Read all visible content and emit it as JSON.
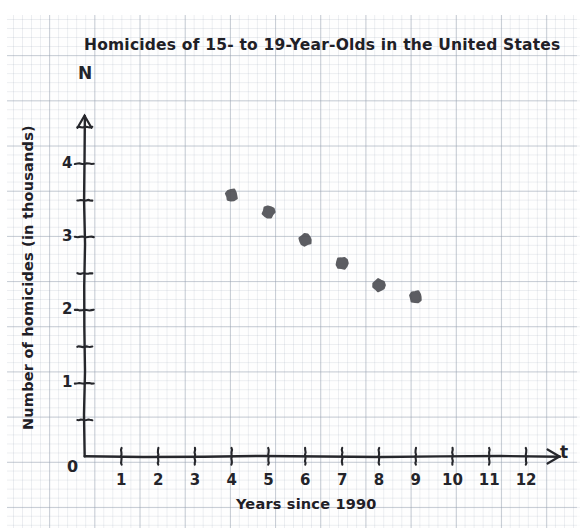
{
  "chart_data": {
    "type": "scatter",
    "title": "Homicides of 15- to 19-Year-Olds in the United States",
    "xlabel": "Years since 1990",
    "ylabel": "Number of homicides (in thousands)",
    "x_variable": "t",
    "y_variable": "N",
    "xlim": [
      0,
      12.8
    ],
    "ylim": [
      0,
      4.6
    ],
    "grid": true,
    "grid_style": "graph-paper",
    "legend": "none",
    "x_ticks": [
      1,
      2,
      3,
      4,
      5,
      6,
      7,
      8,
      9,
      10,
      11,
      12
    ],
    "x_tick_labels": [
      "1",
      "2",
      "3",
      "4",
      "5",
      "6",
      "7",
      "8",
      "9",
      "10",
      "11",
      "12"
    ],
    "y_ticks": [
      0.5,
      1,
      1.5,
      2,
      2.5,
      3,
      3.5,
      4,
      4.5
    ],
    "y_tick_labels": [
      "",
      "1",
      "",
      "2",
      "",
      "3",
      "",
      "4",
      ""
    ],
    "y_labeled_ticks": [
      1,
      2,
      3,
      4
    ],
    "origin_label": "0",
    "x": [
      4,
      5,
      6,
      7,
      8,
      9
    ],
    "y": [
      3.57,
      3.34,
      2.96,
      2.64,
      2.34,
      2.18
    ],
    "points": [
      {
        "t": 4,
        "N": 3.57
      },
      {
        "t": 5,
        "N": 3.34
      },
      {
        "t": 6,
        "N": 2.96
      },
      {
        "t": 7,
        "N": 2.64
      },
      {
        "t": 8,
        "N": 2.34
      },
      {
        "t": 9,
        "N": 2.18
      }
    ],
    "marker_color": "#4f5055",
    "axis_color": "#26272c",
    "grid_color": "#96a0af"
  },
  "annotations": {
    "x_axis_arrow": true,
    "y_axis_arrow": true
  }
}
